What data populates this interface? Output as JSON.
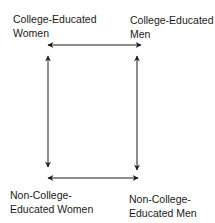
{
  "diagram": {
    "nodes": {
      "top_left": {
        "line1": "College-Educated",
        "line2": "Women"
      },
      "top_right": {
        "line1": "College-Educated",
        "line2": "Men"
      },
      "bottom_left": {
        "line1": "Non-College-",
        "line2": "Educated Women"
      },
      "bottom_right": {
        "line1": "Non-College-",
        "line2": "Educated Men"
      }
    },
    "edges": [
      {
        "from": "top_left",
        "to": "top_right",
        "type": "bidirectional"
      },
      {
        "from": "top_left",
        "to": "bottom_left",
        "type": "bidirectional"
      },
      {
        "from": "top_right",
        "to": "bottom_right",
        "type": "bidirectional"
      },
      {
        "from": "bottom_left",
        "to": "bottom_right",
        "type": "bidirectional"
      }
    ],
    "colors": {
      "line": "#1a1a1a",
      "background": "#ffffff"
    }
  }
}
